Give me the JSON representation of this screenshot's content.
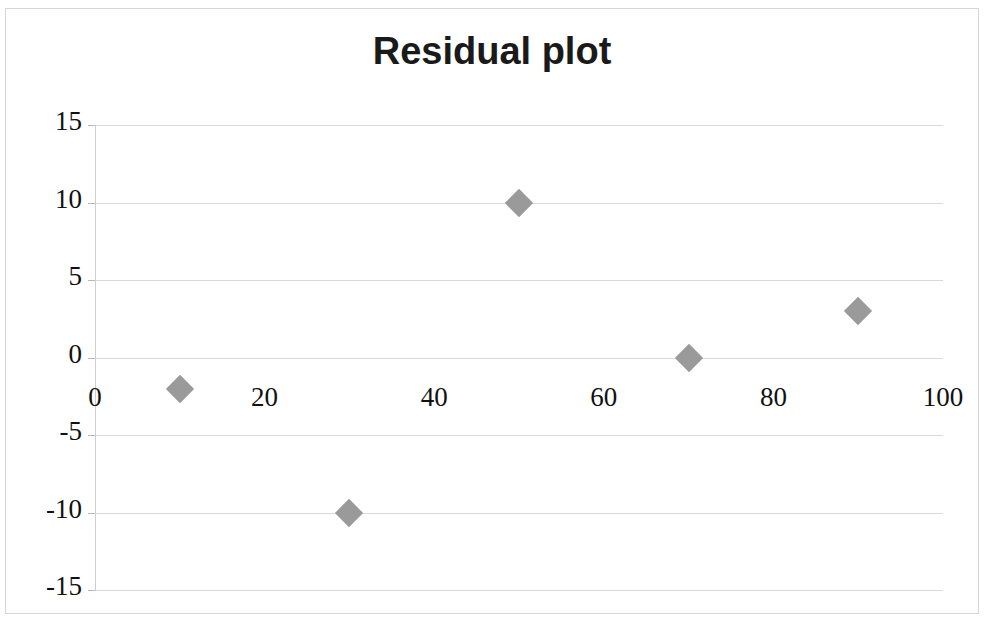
{
  "chart_data": {
    "type": "scatter",
    "title": "Residual plot",
    "xlabel": "",
    "ylabel": "",
    "x": [
      10,
      30,
      50,
      70,
      90
    ],
    "values": [
      -2,
      -10,
      10,
      0,
      3
    ],
    "series": [
      {
        "name": "Residuals",
        "points": [
          {
            "x": 10,
            "y": -2
          },
          {
            "x": 30,
            "y": -10
          },
          {
            "x": 50,
            "y": 10
          },
          {
            "x": 70,
            "y": 0
          },
          {
            "x": 90,
            "y": 3
          }
        ]
      }
    ],
    "xlim": [
      0,
      100
    ],
    "ylim": [
      -15,
      15
    ],
    "x_ticks": [
      0,
      20,
      40,
      60,
      80,
      100
    ],
    "y_ticks": [
      15,
      10,
      5,
      0,
      -5,
      -10,
      -15
    ],
    "x_tick_labels": [
      "0",
      "20",
      "40",
      "60",
      "80",
      "100"
    ],
    "y_tick_labels": [
      "15",
      "10",
      "5",
      "0",
      "-5",
      "-10",
      "-15"
    ],
    "grid": true,
    "legend": false,
    "marker_shape": "diamond",
    "marker_color": "#9a9a9a",
    "gridline_color": "#d9d9d9",
    "axis_color": "#cfcfcf",
    "text_color": "#111111",
    "background_color": "#ffffff"
  }
}
